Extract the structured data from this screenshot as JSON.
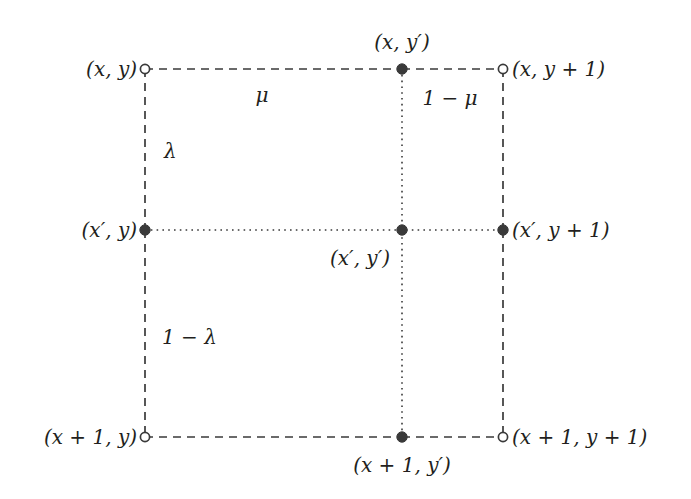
{
  "figure": {
    "width": 691,
    "height": 499,
    "background": "#ffffff",
    "line_color": "#3a3a3a",
    "text_color": "#231f20"
  },
  "grid": {
    "columns": {
      "left": 145,
      "center": 402,
      "right": 503
    },
    "rows": {
      "top": 69,
      "middle": 230,
      "bottom": 437
    }
  },
  "nodes": [
    {
      "id": "top-left",
      "label": "(x, y)",
      "marker": "open",
      "x": 145,
      "y": 69,
      "label_x": 137,
      "label_y": 69,
      "anchor": "right"
    },
    {
      "id": "top-center",
      "label": "(x, y′)",
      "marker": "filled",
      "x": 402,
      "y": 69,
      "label_x": 402,
      "label_y": 52,
      "anchor": "center-above"
    },
    {
      "id": "top-right",
      "label": "(x, y + 1)",
      "marker": "open",
      "x": 503,
      "y": 69,
      "label_x": 512,
      "label_y": 69,
      "anchor": "left"
    },
    {
      "id": "middle-left",
      "label": "(x′, y)",
      "marker": "filled",
      "x": 145,
      "y": 230,
      "label_x": 137,
      "label_y": 230,
      "anchor": "right"
    },
    {
      "id": "middle-center",
      "label": "(x′, y′)",
      "marker": "filled",
      "x": 402,
      "y": 230,
      "label_x": 390,
      "label_y": 258,
      "anchor": "right"
    },
    {
      "id": "middle-right",
      "label": "(x′, y + 1)",
      "marker": "filled",
      "x": 503,
      "y": 230,
      "label_x": 512,
      "label_y": 230,
      "anchor": "left"
    },
    {
      "id": "bottom-left",
      "label": "(x + 1, y)",
      "marker": "open",
      "x": 145,
      "y": 437,
      "label_x": 137,
      "label_y": 437,
      "anchor": "right"
    },
    {
      "id": "bottom-center",
      "label": "(x + 1, y′)",
      "marker": "filled",
      "x": 402,
      "y": 437,
      "label_x": 402,
      "label_y": 455,
      "anchor": "center-below"
    },
    {
      "id": "bottom-right",
      "label": "(x + 1, y + 1)",
      "marker": "open",
      "x": 503,
      "y": 437,
      "label_x": 512,
      "label_y": 437,
      "anchor": "left"
    }
  ],
  "edge_labels": [
    {
      "id": "mu",
      "label": "μ",
      "x": 262,
      "y": 95,
      "anchor": "center"
    },
    {
      "id": "one-minus-mu",
      "label": "1 − μ",
      "x": 450,
      "y": 98,
      "anchor": "center"
    },
    {
      "id": "lambda",
      "label": "λ",
      "x": 164,
      "y": 151,
      "anchor": "left"
    },
    {
      "id": "one-minus-lambda",
      "label": "1 − λ",
      "x": 162,
      "y": 337,
      "anchor": "left"
    }
  ],
  "segments": [
    {
      "id": "top-edge-left",
      "style": "dashed",
      "x1": 145,
      "y1": 69,
      "x2": 402,
      "y2": 69
    },
    {
      "id": "top-edge-right",
      "style": "dashed",
      "x1": 402,
      "y1": 69,
      "x2": 503,
      "y2": 69
    },
    {
      "id": "left-edge-upper",
      "style": "dashed",
      "x1": 145,
      "y1": 69,
      "x2": 145,
      "y2": 230
    },
    {
      "id": "left-edge-lower",
      "style": "dashed",
      "x1": 145,
      "y1": 230,
      "x2": 145,
      "y2": 437
    },
    {
      "id": "right-edge-upper",
      "style": "dashed",
      "x1": 503,
      "y1": 69,
      "x2": 503,
      "y2": 230
    },
    {
      "id": "right-edge-lower",
      "style": "dashed",
      "x1": 503,
      "y1": 230,
      "x2": 503,
      "y2": 437
    },
    {
      "id": "bottom-edge-left",
      "style": "dashed",
      "x1": 145,
      "y1": 437,
      "x2": 402,
      "y2": 437
    },
    {
      "id": "bottom-edge-right",
      "style": "dashed",
      "x1": 402,
      "y1": 437,
      "x2": 503,
      "y2": 437
    },
    {
      "id": "center-vertical",
      "style": "dotted",
      "x1": 402,
      "y1": 69,
      "x2": 402,
      "y2": 437
    },
    {
      "id": "center-horizontal",
      "style": "dotted",
      "x1": 145,
      "y1": 230,
      "x2": 503,
      "y2": 230
    }
  ]
}
